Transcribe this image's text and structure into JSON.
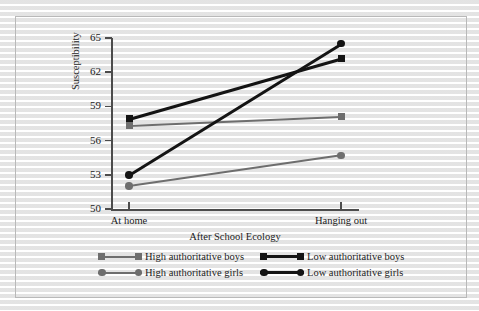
{
  "figure": {
    "background_color": "#ffffff",
    "frame_color": "#b9b9b9",
    "axis_color": "#4c4c4c"
  },
  "chart_data": {
    "type": "line",
    "title": "",
    "xlabel": "After School Ecology",
    "ylabel": "Susceptibility",
    "categories": [
      "At home",
      "Hanging out"
    ],
    "x": [
      0,
      1
    ],
    "ylim": [
      50,
      65
    ],
    "yticks": [
      50,
      53,
      56,
      59,
      62,
      65
    ],
    "ytick_labels": [
      "50",
      "53",
      "56",
      "59",
      "62",
      "65"
    ],
    "grid": false,
    "legend_position": "below-axes",
    "series": [
      {
        "name": "High authoritative boys",
        "values": [
          57.3,
          58.1
        ],
        "color": "#6e6e6e",
        "marker": "square"
      },
      {
        "name": "Low authoritative boys",
        "values": [
          57.9,
          63.2
        ],
        "color": "#141414",
        "marker": "square"
      },
      {
        "name": "High authoritative girls",
        "values": [
          52.0,
          54.7
        ],
        "color": "#6e6e6e",
        "marker": "circle"
      },
      {
        "name": "Low authoritative girls",
        "values": [
          53.0,
          64.5
        ],
        "color": "#141414",
        "marker": "circle"
      }
    ]
  }
}
